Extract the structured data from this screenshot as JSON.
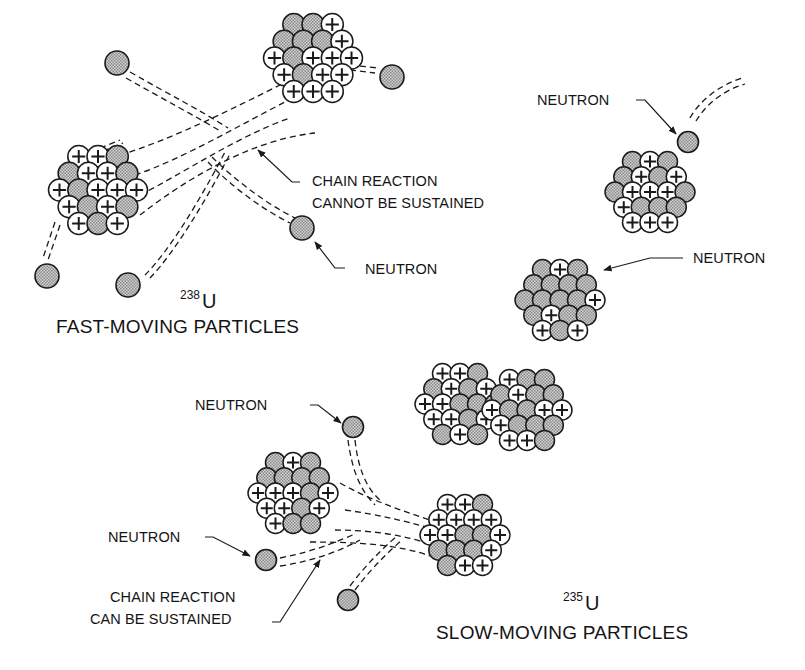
{
  "figure": {
    "colors": {
      "ink": "#1a1a1a",
      "neutron_fill": "#b8b8b8",
      "proton_fill": "#ffffff",
      "background": "#ffffff"
    },
    "panels": [
      {
        "id": "u238",
        "isotope_mass": "238",
        "isotope_symbol": "U",
        "caption": "FAST-MOVING PARTICLES",
        "labels": {
          "chain": [
            "CHAIN REACTION",
            "CANNOT BE SUSTAINED"
          ],
          "neutron": "NEUTRON"
        }
      },
      {
        "id": "fission-sequence",
        "labels": {
          "neutron_incoming": "NEUTRON",
          "neutron_absorbed": "NEUTRON"
        }
      },
      {
        "id": "u235",
        "isotope_mass": "235",
        "isotope_symbol": "U",
        "caption": "SLOW-MOVING PARTICLES",
        "labels": {
          "neutron_top": "NEUTRON",
          "neutron_left": "NEUTRON",
          "chain": [
            "CHAIN REACTION",
            "CAN BE SUSTAINED"
          ]
        }
      }
    ],
    "legend_glyphs": {
      "proton": "+",
      "neutron": "shaded circle"
    }
  }
}
